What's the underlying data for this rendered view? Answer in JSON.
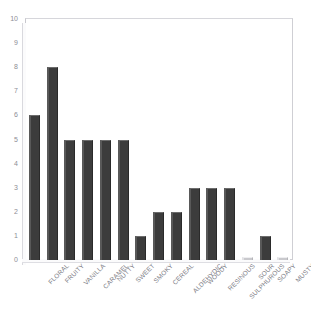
{
  "chart_data": {
    "type": "bar",
    "title": "",
    "xlabel": "",
    "ylabel": "",
    "ylim": [
      0,
      10
    ],
    "yticks": [
      0,
      1,
      2,
      3,
      4,
      5,
      6,
      7,
      8,
      9,
      10
    ],
    "grid": false,
    "legend": null,
    "bar_color": "#3c3c3c",
    "categories": [
      "FLORAL",
      "FRUITY",
      "VANILLA",
      "CARAMEL",
      "NUTTY",
      "SWEET",
      "SMOKY",
      "CEREAL",
      "ALDEHYDIC",
      "WOODY",
      "RESINOUS",
      "SULPHUROUS",
      "SOUR",
      "SOAPY",
      "MUSTY"
    ],
    "values": [
      6,
      8,
      5,
      5,
      5,
      5,
      1,
      2,
      2,
      3,
      3,
      3,
      0,
      1,
      0
    ]
  }
}
